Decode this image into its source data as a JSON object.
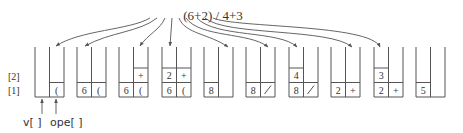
{
  "expression": {
    "text": "(6+2) / 4+3",
    "tokens": [
      "(",
      "6",
      "+",
      "2",
      ")",
      "/",
      "4",
      "+",
      "3"
    ]
  },
  "row_labels": [
    "[2]",
    "[1]"
  ],
  "bottom_labels": {
    "values_stack": "v[ ]",
    "operator_stack": "ope[ ]"
  },
  "stacks": [
    {
      "step": 1,
      "v": [],
      "ope": [
        "("
      ]
    },
    {
      "step": 2,
      "v": [
        "6"
      ],
      "ope": [
        "("
      ]
    },
    {
      "step": 3,
      "v": [
        "6"
      ],
      "ope": [
        "(",
        "+"
      ]
    },
    {
      "step": 4,
      "v": [
        "6",
        "2"
      ],
      "ope": [
        "(",
        "+"
      ]
    },
    {
      "step": 5,
      "v": [
        "8"
      ],
      "ope": []
    },
    {
      "step": 6,
      "v": [
        "8"
      ],
      "ope": [
        "/"
      ]
    },
    {
      "step": 7,
      "v": [
        "8",
        "4"
      ],
      "ope": [
        "/"
      ]
    },
    {
      "step": 8,
      "v": [
        "2"
      ],
      "ope": [
        "+"
      ]
    },
    {
      "step": 9,
      "v": [
        "2",
        "3"
      ],
      "ope": [
        "+"
      ]
    },
    {
      "step": 10,
      "v": [
        "5"
      ],
      "ope": []
    }
  ],
  "colors": {
    "line": "#555555",
    "text": "#333333",
    "background": "#ffffff"
  }
}
